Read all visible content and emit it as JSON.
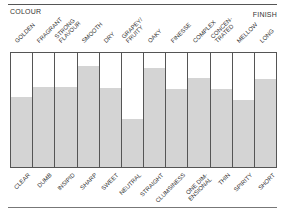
{
  "header": {
    "left_label": "COLOUR",
    "right_label": "FINISH"
  },
  "chart_data": {
    "type": "bar",
    "title": "",
    "xlabel": "",
    "ylabel": "",
    "ylim": [
      0,
      100
    ],
    "grid": false,
    "legend": null,
    "top_labels": [
      "GOLDEN",
      "FRAGRANT",
      "STRONG\nFLAVOUR",
      "SMOOTH",
      "DRY",
      "GRAPEY/\nFRUITY",
      "OAKY",
      "FINESSE",
      "COMPLEX",
      "CONCEN-\nTRATED",
      "MELLOW",
      "LONG"
    ],
    "bottom_labels": [
      "CLEAR",
      "DUMB",
      "INSIPID",
      "SHARP",
      "SWEET",
      "NEUTRAL",
      "STRAIGHT",
      "CLUMSINESS",
      "ONE DIM-\nENSIONAL",
      "THIN",
      "SPIRITY",
      "SHORT"
    ],
    "categories": [
      "GOLDEN / CLEAR",
      "FRAGRANT / DUMB",
      "STRONG FLAVOUR / INSIPID",
      "SMOOTH / SHARP",
      "DRY / SWEET",
      "GRAPEY/FRUITY / NEUTRAL",
      "OAKY / STRAIGHT",
      "FINESSE / CLUMSINESS",
      "COMPLEX / ONE DIMENSIONAL",
      "CONCENTRATED / THIN",
      "MELLOW / SPIRITY",
      "LONG / SHORT"
    ],
    "values": [
      61,
      70,
      70,
      89,
      69,
      42,
      87,
      68,
      78,
      68,
      59,
      77
    ],
    "fill_color": "#d4d4d4",
    "border_color": "#555555"
  }
}
